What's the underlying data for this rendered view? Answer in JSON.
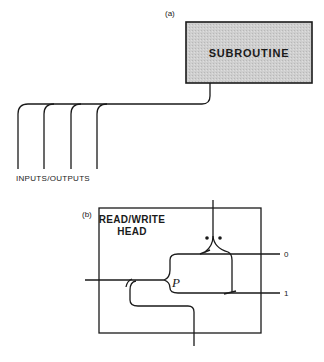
{
  "figure": {
    "panel_a": {
      "label": "(a)",
      "box_label": "SUBROUTINE",
      "box_fill": "#c8c8c8",
      "io_label": "INPUTS/OUTPUTS",
      "io_line_count": 4
    },
    "panel_b": {
      "label": "(b)",
      "title_line1": "READ/WRITE",
      "title_line2": "HEAD",
      "junction_label": "P",
      "output_0": "0",
      "output_1": "1"
    },
    "colors": {
      "line": "#1a1a1a",
      "background": "#ffffff"
    }
  }
}
